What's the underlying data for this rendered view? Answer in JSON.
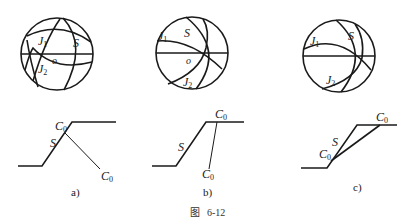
{
  "figure": {
    "caption_prefix": "图",
    "caption_number": "6-12"
  },
  "panels": [
    {
      "id": "a",
      "label": "a)",
      "stereonet": {
        "labels": {
          "j1": "J",
          "j1_sub": "1",
          "j2": "J",
          "j2_sub": "2",
          "s": "S",
          "o": "o"
        }
      },
      "section": {
        "labels": {
          "c0_top": "C",
          "c0_top_sub": "0",
          "c0_bottom": "C",
          "c0_bottom_sub": "0",
          "s": "S"
        }
      }
    },
    {
      "id": "b",
      "label": "b)",
      "stereonet": {
        "labels": {
          "j1": "J",
          "j1_sub": "1",
          "j2": "J",
          "j2_sub": "2",
          "s": "S",
          "o": "o"
        }
      },
      "section": {
        "labels": {
          "c0_top": "C",
          "c0_top_sub": "0",
          "c0_bottom": "C",
          "c0_bottom_sub": "0",
          "s": "S"
        }
      }
    },
    {
      "id": "c",
      "label": "c)",
      "stereonet": {
        "labels": {
          "j1": "J",
          "j1_sub": "1",
          "j2": "J",
          "j2_sub": "2",
          "s": "S"
        }
      },
      "section": {
        "labels": {
          "c0_top": "C",
          "c0_top_sub": "0",
          "c0_bottom": "C",
          "c0_bottom_sub": "0",
          "s": "S"
        }
      }
    }
  ]
}
